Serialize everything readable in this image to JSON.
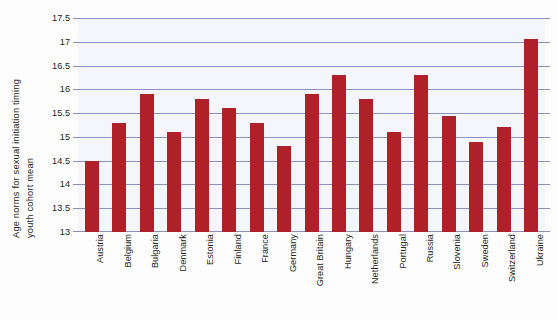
{
  "chart_data": {
    "type": "bar",
    "title": "",
    "xlabel": "",
    "ylabel": "Age norms for sexual initiation timing youth cohort mean",
    "ylabel_lines": [
      "Age norms for sexual initiation timing",
      "youth cohort mean"
    ],
    "ylim": [
      13,
      17.5
    ],
    "ytick_step": 0.5,
    "ytick_labels": [
      "17.5",
      "17",
      "16.5",
      "16",
      "15.5",
      "15",
      "14.5",
      "14",
      "13.5",
      "13"
    ],
    "ytick_values": [
      17.5,
      17,
      16.5,
      16,
      15.5,
      15,
      14.5,
      14,
      13.5,
      13
    ],
    "grid": true,
    "legend": "none",
    "categories": [
      "Austria",
      "Belgium",
      "Bulgaria",
      "Denmark",
      "Estonia",
      "Finland",
      "France",
      "Germany",
      "Great Britain",
      "Hungary",
      "Netherlands",
      "Portugal",
      "Russia",
      "Slovenia",
      "Sweden",
      "Switzerland",
      "Ukraine"
    ],
    "values": [
      14.5,
      15.3,
      15.9,
      15.1,
      15.8,
      15.6,
      15.3,
      14.8,
      15.9,
      16.3,
      15.8,
      15.1,
      16.3,
      15.45,
      14.9,
      15.2,
      17.05
    ],
    "bar_color": "#b02028",
    "gridline_color": "#8b90bd",
    "plot_background": "#f4f6fb",
    "text_color": "#231f20"
  }
}
